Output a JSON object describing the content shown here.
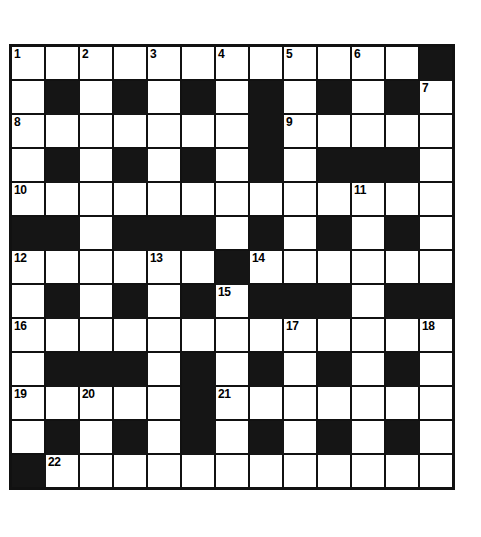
{
  "puzzle": {
    "title": "Crossword Grid",
    "rows": 13,
    "cols": 13,
    "cell_size_px": 32,
    "colors": {
      "block": "#151515",
      "open": "#ffffff",
      "grid_line": "#111111",
      "number_text": "#000000"
    },
    "numbers_visible": [
      1,
      2,
      3,
      4,
      5,
      6,
      7,
      8,
      9,
      10,
      11,
      12,
      13,
      14,
      15,
      16,
      17,
      18,
      19,
      20,
      21,
      22
    ],
    "grid": [
      [
        "open",
        "open",
        "open",
        "open",
        "open",
        "open",
        "open",
        "open",
        "open",
        "open",
        "open",
        "open",
        "block"
      ],
      [
        "open",
        "block",
        "open",
        "block",
        "open",
        "block",
        "open",
        "block",
        "open",
        "block",
        "open",
        "block",
        "open"
      ],
      [
        "open",
        "open",
        "open",
        "open",
        "open",
        "open",
        "open",
        "block",
        "open",
        "open",
        "open",
        "open",
        "open"
      ],
      [
        "open",
        "block",
        "open",
        "block",
        "open",
        "block",
        "open",
        "block",
        "open",
        "block",
        "block",
        "block",
        "open"
      ],
      [
        "open",
        "open",
        "open",
        "open",
        "open",
        "open",
        "open",
        "open",
        "open",
        "open",
        "open",
        "open",
        "open"
      ],
      [
        "block",
        "block",
        "open",
        "block",
        "block",
        "block",
        "open",
        "block",
        "open",
        "block",
        "open",
        "block",
        "open"
      ],
      [
        "open",
        "open",
        "open",
        "open",
        "open",
        "open",
        "block",
        "open",
        "open",
        "open",
        "open",
        "open",
        "open"
      ],
      [
        "open",
        "block",
        "open",
        "block",
        "open",
        "block",
        "open",
        "block",
        "block",
        "block",
        "open",
        "block",
        "block"
      ],
      [
        "open",
        "open",
        "open",
        "open",
        "open",
        "open",
        "open",
        "open",
        "open",
        "open",
        "open",
        "open",
        "open"
      ],
      [
        "open",
        "block",
        "block",
        "block",
        "open",
        "block",
        "open",
        "block",
        "open",
        "block",
        "open",
        "block",
        "open"
      ],
      [
        "open",
        "open",
        "open",
        "open",
        "open",
        "block",
        "open",
        "open",
        "open",
        "open",
        "open",
        "open",
        "open"
      ],
      [
        "open",
        "block",
        "open",
        "block",
        "open",
        "block",
        "open",
        "block",
        "open",
        "block",
        "open",
        "block",
        "open"
      ],
      [
        "block",
        "open",
        "open",
        "open",
        "open",
        "open",
        "open",
        "open",
        "open",
        "open",
        "open",
        "open",
        "open"
      ]
    ],
    "numbers": [
      {
        "row": 0,
        "col": 0,
        "n": "1"
      },
      {
        "row": 0,
        "col": 2,
        "n": "2"
      },
      {
        "row": 0,
        "col": 4,
        "n": "3"
      },
      {
        "row": 0,
        "col": 6,
        "n": "4"
      },
      {
        "row": 0,
        "col": 8,
        "n": "5"
      },
      {
        "row": 0,
        "col": 10,
        "n": "6"
      },
      {
        "row": 1,
        "col": 12,
        "n": "7"
      },
      {
        "row": 2,
        "col": 0,
        "n": "8"
      },
      {
        "row": 2,
        "col": 8,
        "n": "9"
      },
      {
        "row": 4,
        "col": 0,
        "n": "10"
      },
      {
        "row": 4,
        "col": 10,
        "n": "11"
      },
      {
        "row": 6,
        "col": 0,
        "n": "12"
      },
      {
        "row": 6,
        "col": 4,
        "n": "13"
      },
      {
        "row": 6,
        "col": 7,
        "n": "14"
      },
      {
        "row": 7,
        "col": 6,
        "n": "15"
      },
      {
        "row": 8,
        "col": 0,
        "n": "16"
      },
      {
        "row": 8,
        "col": 8,
        "n": "17"
      },
      {
        "row": 8,
        "col": 12,
        "n": "18"
      },
      {
        "row": 10,
        "col": 0,
        "n": "19"
      },
      {
        "row": 10,
        "col": 2,
        "n": "20"
      },
      {
        "row": 10,
        "col": 6,
        "n": "21"
      },
      {
        "row": 12,
        "col": 1,
        "n": "22"
      }
    ],
    "letters": []
  }
}
